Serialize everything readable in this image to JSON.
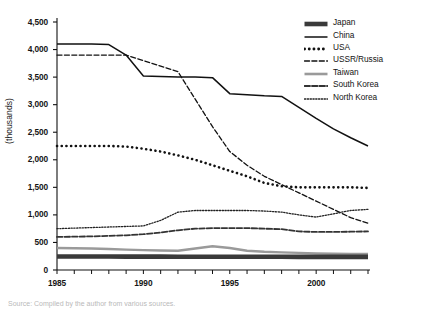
{
  "axes": {
    "ylabel": "(thousands)",
    "yticks": [
      "0",
      "500",
      "1,000",
      "1,500",
      "2,000",
      "2,500",
      "3,000",
      "3,500",
      "4,000",
      "4,500"
    ],
    "xticks": [
      "1985",
      "1990",
      "1995",
      "2000"
    ]
  },
  "legend": {
    "items": [
      {
        "label": "Japan",
        "style": "thick-solid",
        "color": "#3a3a3a"
      },
      {
        "label": "China",
        "style": "solid",
        "color": "#111111"
      },
      {
        "label": "USA",
        "style": "dotted-bold",
        "color": "#111111"
      },
      {
        "label": "USSR/Russia",
        "style": "dashed",
        "color": "#111111"
      },
      {
        "label": "Taiwan",
        "style": "solid-gray",
        "color": "#9a9a9a"
      },
      {
        "label": "South Korea",
        "style": "dash-dot",
        "color": "#333333"
      },
      {
        "label": "North Korea",
        "style": "fine-dotted",
        "color": "#222222"
      }
    ]
  },
  "caption": "Source: Compiled by the author from various sources.",
  "chart_data": {
    "type": "line",
    "title": "",
    "xlabel": "",
    "ylabel": "(thousands)",
    "xlim": [
      1985,
      2003
    ],
    "ylim": [
      0,
      4500
    ],
    "grid": false,
    "legend_position": "top-right",
    "x": [
      1985,
      1986,
      1987,
      1988,
      1989,
      1990,
      1991,
      1992,
      1993,
      1994,
      1995,
      1996,
      1997,
      1998,
      1999,
      2000,
      2001,
      2002,
      2003
    ],
    "series": [
      {
        "name": "China",
        "color": "#111111",
        "style": "solid",
        "width": 1.5,
        "values": [
          4100,
          4100,
          4100,
          4090,
          3900,
          3520,
          3510,
          3500,
          3500,
          3490,
          3200,
          3180,
          3160,
          3150,
          2950,
          2750,
          2560,
          2400,
          2250
        ]
      },
      {
        "name": "USSR/Russia",
        "color": "#111111",
        "style": "dashed",
        "width": 1.3,
        "values": [
          3900,
          3900,
          3900,
          3900,
          3900,
          3800,
          3700,
          3600,
          3100,
          2600,
          2150,
          1900,
          1700,
          1550,
          1400,
          1250,
          1100,
          950,
          850
        ]
      },
      {
        "name": "USA",
        "color": "#111111",
        "style": "dotted-bold",
        "width": 2.6,
        "values": [
          2250,
          2250,
          2250,
          2250,
          2240,
          2200,
          2150,
          2080,
          2000,
          1900,
          1800,
          1700,
          1580,
          1520,
          1500,
          1500,
          1500,
          1500,
          1490
        ]
      },
      {
        "name": "North Korea",
        "color": "#222222",
        "style": "fine-dotted",
        "width": 1.3,
        "values": [
          750,
          760,
          770,
          780,
          790,
          800,
          900,
          1050,
          1080,
          1080,
          1080,
          1080,
          1070,
          1050,
          1000,
          960,
          1020,
          1080,
          1100
        ]
      },
      {
        "name": "South Korea",
        "color": "#333333",
        "style": "dash-dot",
        "width": 1.8,
        "values": [
          600,
          605,
          610,
          620,
          630,
          650,
          680,
          720,
          750,
          760,
          760,
          760,
          750,
          740,
          700,
          690,
          690,
          695,
          700
        ]
      },
      {
        "name": "Taiwan",
        "color": "#9a9a9a",
        "style": "solid-gray",
        "width": 2.4,
        "values": [
          400,
          395,
          390,
          380,
          370,
          360,
          355,
          350,
          390,
          430,
          400,
          350,
          330,
          320,
          310,
          300,
          295,
          292,
          290
        ]
      },
      {
        "name": "Japan",
        "color": "#3a3a3a",
        "style": "thick-solid",
        "width": 4.6,
        "values": [
          245,
          245,
          245,
          244,
          243,
          242,
          242,
          241,
          241,
          240,
          240,
          240,
          240,
          240,
          239,
          239,
          238,
          238,
          238
        ]
      }
    ]
  }
}
